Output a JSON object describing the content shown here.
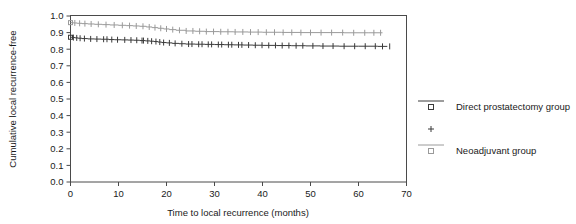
{
  "chart_data": {
    "type": "line",
    "title": "",
    "xlabel": "Time to local recurrence (months)",
    "ylabel": "Cumulative local recurrence-free",
    "xlim": [
      0,
      70
    ],
    "ylim": [
      0.0,
      1.0
    ],
    "xticks": [
      0,
      10,
      20,
      30,
      40,
      50,
      60,
      70
    ],
    "xtick_labels": [
      "0",
      "10",
      "20",
      "30",
      "40",
      "50",
      "60",
      "70"
    ],
    "yticks": [
      0.0,
      0.1,
      0.2,
      0.3,
      0.4,
      0.5,
      0.6,
      0.7,
      0.8,
      0.9,
      1.0
    ],
    "ytick_labels": [
      "0.0",
      "0.1",
      "0.2",
      "0.3",
      "0.4",
      "0.5",
      "0.6",
      "0.7",
      "0.8",
      "0.9",
      "1.0"
    ],
    "grid": false,
    "legend_position": "right",
    "series": [
      {
        "name": "Direct prostatectomy group",
        "color": "#3a3a3a",
        "marker": "square-plus",
        "x": [
          0,
          0.4,
          1.0,
          1.6,
          2.4,
          3.6,
          5.0,
          6.4,
          8.0,
          9.2,
          10.6,
          12.0,
          13.2,
          14.4,
          15.6,
          16.6,
          17.4,
          18.2,
          19.0,
          20.0,
          21.2,
          22.6,
          24.0,
          26.0,
          28.0,
          30.0,
          32.0,
          34.0,
          36.0,
          38.0,
          40.0,
          43.0,
          46.0,
          49.0,
          52.0,
          56.0,
          60.0,
          64.0,
          66.0
        ],
        "y": [
          0.872,
          0.87,
          0.868,
          0.866,
          0.864,
          0.862,
          0.861,
          0.86,
          0.858,
          0.857,
          0.856,
          0.855,
          0.854,
          0.852,
          0.85,
          0.848,
          0.846,
          0.843,
          0.84,
          0.838,
          0.835,
          0.833,
          0.831,
          0.83,
          0.829,
          0.828,
          0.827,
          0.826,
          0.825,
          0.824,
          0.823,
          0.822,
          0.821,
          0.82,
          0.819,
          0.818,
          0.818,
          0.817,
          0.817
        ],
        "censor_x": [
          0.6,
          1.3,
          2.0,
          2.9,
          4.2,
          5.5,
          6.9,
          7.6,
          8.6,
          9.8,
          11.3,
          12.6,
          13.8,
          14.9,
          15.2,
          16.1,
          16.9,
          17.8,
          18.6,
          19.4,
          20.6,
          21.8,
          23.2,
          24.6,
          25.3,
          26.7,
          27.4,
          28.7,
          29.4,
          30.8,
          31.5,
          32.9,
          33.6,
          35.0,
          35.7,
          37.1,
          38.5,
          39.9,
          41.3,
          42.7,
          44.1,
          45.5,
          47.0,
          48.4,
          50.5,
          52.6,
          54.7,
          57.0,
          59.2,
          61.4,
          63.5,
          65.0,
          66.5
        ]
      },
      {
        "name": "Neoadjuvant group",
        "color": "#9a9a9a",
        "marker": "square-plus",
        "x": [
          0,
          0.6,
          1.4,
          2.4,
          3.6,
          5.0,
          6.6,
          8.2,
          10.0,
          11.6,
          13.0,
          14.4,
          15.8,
          17.0,
          18.2,
          19.4,
          20.6,
          22.0,
          24.0,
          26.0,
          28.0,
          31.0,
          34.0,
          37.0,
          40.0,
          44.0,
          48.0,
          52.0,
          57.0,
          62.0,
          65.0
        ],
        "y": [
          0.96,
          0.958,
          0.956,
          0.954,
          0.952,
          0.95,
          0.948,
          0.946,
          0.944,
          0.942,
          0.94,
          0.938,
          0.934,
          0.93,
          0.926,
          0.922,
          0.918,
          0.914,
          0.91,
          0.908,
          0.906,
          0.905,
          0.904,
          0.903,
          0.902,
          0.901,
          0.9,
          0.9,
          0.899,
          0.899,
          0.899
        ],
        "censor_x": [
          0.9,
          1.9,
          3.0,
          4.3,
          5.8,
          7.4,
          9.1,
          10.8,
          12.3,
          13.7,
          15.1,
          16.4,
          17.6,
          18.8,
          20.0,
          21.3,
          22.7,
          24.1,
          25.5,
          26.9,
          28.3,
          29.8,
          31.3,
          32.8,
          34.3,
          35.9,
          37.5,
          39.1,
          40.8,
          42.5,
          44.3,
          46.1,
          48.0,
          50.0,
          52.2,
          54.4,
          56.7,
          59.0,
          61.3,
          63.2,
          64.6
        ]
      }
    ],
    "legend_entries": [
      {
        "label": "Direct prostatectomy group",
        "marker": "square-open-dark",
        "color": "#3a3a3a",
        "has_line": true
      },
      {
        "label": "",
        "marker": "plus",
        "color": "#3a3a3a",
        "has_line": false
      },
      {
        "label": "Neoadjuvant group",
        "marker": "square-open-light",
        "color": "#9a9a9a",
        "has_line": true
      }
    ]
  },
  "figure": {
    "background_color": "#ffffff",
    "frame_color": "#4a4a4a"
  }
}
